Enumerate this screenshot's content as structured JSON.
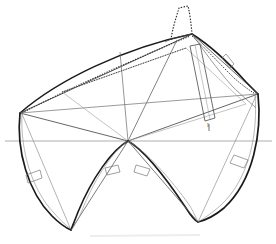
{
  "figure": {
    "kind": "technical-line-drawing",
    "canvas": {
      "width": 276,
      "height": 244,
      "background": "#ffffff"
    },
    "colors": {
      "heavy_line": "#1a1a1a",
      "medium_line": "#3c3c3c",
      "light_line": "#8a8a8a",
      "hairline": "#a8a8a8",
      "dotted_line": "#2e2e2e",
      "smudge": "#d8d8d8"
    },
    "annotations": {
      "station_tick": "l"
    },
    "key_points": {
      "center_vertex": [
        128,
        141
      ],
      "left_vertex": [
        20,
        113
      ],
      "right_vertex": [
        258,
        94
      ],
      "stem_head": [
        192,
        34
      ],
      "keel_left": [
        71,
        230
      ],
      "keel_right": [
        198,
        222
      ],
      "waterline_y": 141,
      "waterline_x_start": 5,
      "waterline_x_end": 272
    },
    "elements": {
      "waterline": "waterline-baseline",
      "stem": "stem-curve-dotted",
      "sheer_upper": "sheer-line-upper",
      "sheer_dotted": "sheer-line-dotted",
      "plank": "mast-plank-parallelogram",
      "hull_left": "hull-section-left",
      "hull_right": "hull-section-right",
      "gauge_left": "gauge-mark-left",
      "gauge_right": "gauge-mark-right",
      "gauge_inner_left": "gauge-mark-inner-left",
      "gauge_inner_right": "gauge-mark-inner-right",
      "gauge_upper_right": "gauge-mark-upper-right"
    }
  }
}
